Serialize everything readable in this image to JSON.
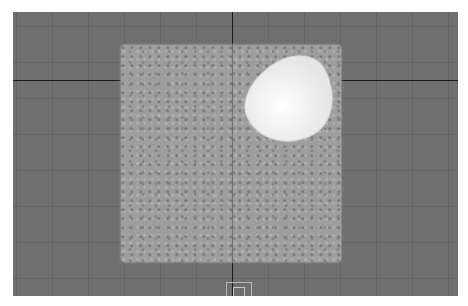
{
  "viewport": {
    "background_color": "#6f6f6f",
    "axis_color": "#1a1a1a",
    "objects": [
      {
        "name": "particle-plane",
        "color": "#9e9e9e"
      },
      {
        "name": "highlighted-blob",
        "color": "#f2f2f2"
      }
    ],
    "gizmo": "camera-gizmo-icon"
  }
}
